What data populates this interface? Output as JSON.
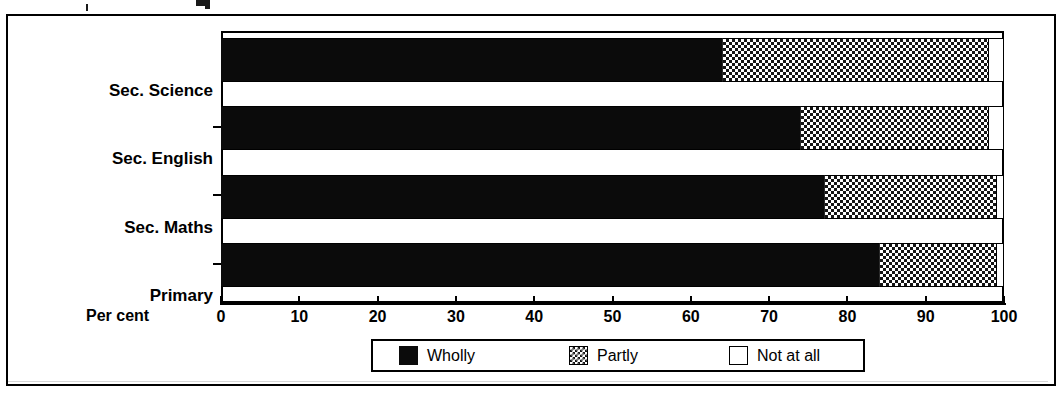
{
  "chart_data": {
    "type": "bar",
    "orientation": "horizontal",
    "stacked": true,
    "title": "",
    "xlabel": "Per cent",
    "ylabel": "",
    "xlim": [
      0,
      100
    ],
    "xticks": [
      0,
      10,
      20,
      30,
      40,
      50,
      60,
      70,
      80,
      90,
      100
    ],
    "xticklabels": [
      "0",
      "10",
      "20",
      "30",
      "40",
      "50",
      "60",
      "70",
      "80",
      "90",
      "100"
    ],
    "grid": false,
    "legend_position": "bottom",
    "categories": [
      "Sec. Science",
      "Sec. English",
      "Sec. Maths",
      "Primary"
    ],
    "series": [
      {
        "name": "Wholly",
        "values": [
          64,
          74,
          77,
          84
        ],
        "fill": "solid-black"
      },
      {
        "name": "Partly",
        "values": [
          34,
          24,
          22,
          15
        ],
        "fill": "checkerboard"
      },
      {
        "name": "Not at all",
        "values": [
          2,
          2,
          1,
          1
        ],
        "fill": "white"
      }
    ]
  },
  "axis": {
    "x_label": "Per cent",
    "tick_labels": [
      "0",
      "10",
      "20",
      "30",
      "40",
      "50",
      "60",
      "70",
      "80",
      "90",
      "100"
    ]
  },
  "categories": [
    {
      "label": "Sec. Science"
    },
    {
      "label": "Sec. English"
    },
    {
      "label": "Sec. Maths"
    },
    {
      "label": "Primary"
    }
  ],
  "legend": {
    "items": [
      {
        "label": "Wholly",
        "swatch": "solid-black-swatch"
      },
      {
        "label": "Partly",
        "swatch": "checkered-swatch"
      },
      {
        "label": "Not at all",
        "swatch": "empty-swatch"
      }
    ]
  },
  "colors": {
    "wholly": "#0b0b0b",
    "partly": "#151515",
    "not_at_all": "#ffffff",
    "axis": "#000000",
    "background": "#ffffff"
  }
}
